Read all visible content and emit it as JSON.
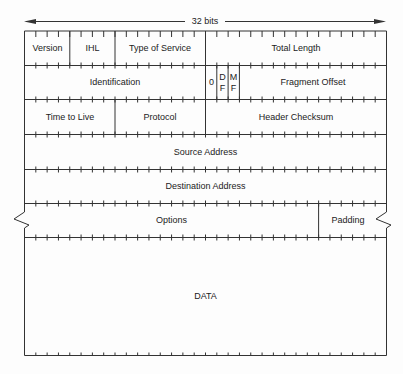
{
  "title": "32 bits",
  "bits_per_row": 32,
  "colors": {
    "line": "#333333",
    "text": "#222222",
    "background": "#fdfdfd"
  },
  "rows": [
    {
      "fields": [
        {
          "label": "Version",
          "bits": 4
        },
        {
          "label": "IHL",
          "bits": 4
        },
        {
          "label": "Type of Service",
          "bits": 8
        },
        {
          "label": "Total Length",
          "bits": 16
        }
      ]
    },
    {
      "fields": [
        {
          "label": "Identification",
          "bits": 16
        },
        {
          "label": "0",
          "bits": 1
        },
        {
          "label": "D F",
          "bits": 1
        },
        {
          "label": "M F",
          "bits": 1
        },
        {
          "label": "Fragment Offset",
          "bits": 13
        }
      ]
    },
    {
      "fields": [
        {
          "label": "Time to Live",
          "bits": 8
        },
        {
          "label": "Protocol",
          "bits": 8
        },
        {
          "label": "Header Checksum",
          "bits": 16
        }
      ]
    },
    {
      "fields": [
        {
          "label": "Source Address",
          "bits": 32
        }
      ]
    },
    {
      "fields": [
        {
          "label": "Destination Address",
          "bits": 32
        }
      ]
    },
    {
      "fields": [
        {
          "label": "Options",
          "bits": 24
        },
        {
          "label": "Padding",
          "bits": 8
        }
      ]
    },
    {
      "fields": [
        {
          "label": "DATA",
          "bits": 32
        }
      ]
    }
  ],
  "labels": {
    "bits": "32 bits",
    "version": "Version",
    "ihl": "IHL",
    "tos": "Type of Service",
    "total_length": "Total Length",
    "identification": "Identification",
    "zero": "0",
    "df_1": "D",
    "df_2": "F",
    "mf_1": "M",
    "mf_2": "F",
    "fragment_offset": "Fragment Offset",
    "ttl": "Time to Live",
    "protocol": "Protocol",
    "header_checksum": "Header Checksum",
    "source_address": "Source Address",
    "destination_address": "Destination Address",
    "options": "Options",
    "padding": "Padding",
    "data": "DATA"
  }
}
